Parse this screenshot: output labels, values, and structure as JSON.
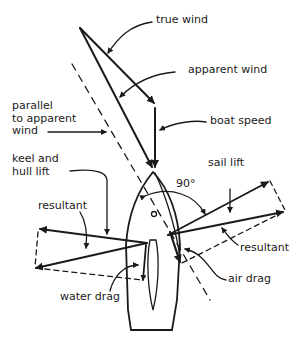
{
  "diagram": {
    "labels": {
      "true_wind": "true wind",
      "apparent_wind": "apparent wind",
      "parallel": "parallel\nto apparent\nwind",
      "boat_speed": "boat speed",
      "keel_hull_lift": "keel and\nhull lift",
      "angle": "90°",
      "sail_lift": "sail lift",
      "resultant_left": "resultant",
      "resultant_right": "resultant",
      "air_drag": "air drag",
      "water_drag": "water drag"
    },
    "colors": {
      "ink": "#1a1a1a",
      "background": "#ffffff"
    }
  }
}
